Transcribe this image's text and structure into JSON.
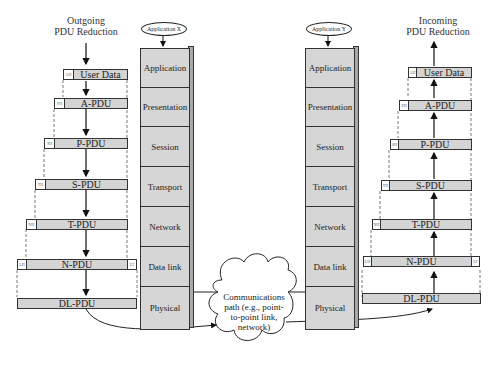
{
  "left": {
    "caption_line1": "Outgoing",
    "caption_line2": "PDU Reduction",
    "pdus": [
      {
        "label": "User Data",
        "header": "AH"
      },
      {
        "label": "A-PDU",
        "header": "PH"
      },
      {
        "label": "P-PDU",
        "header": "SH"
      },
      {
        "label": "S-PDU",
        "header": "TH"
      },
      {
        "label": "T-PDU",
        "header": "NH"
      },
      {
        "label": "N-PDU",
        "header": "LH",
        "trailer": "LT"
      },
      {
        "label": "DL-PDU"
      }
    ]
  },
  "right": {
    "caption_line1": "Incoming",
    "caption_line2": "PDU Reduction",
    "pdus": [
      {
        "label": "User Data",
        "header": "AH"
      },
      {
        "label": "A-PDU",
        "header": "PH"
      },
      {
        "label": "P-PDU",
        "header": "SH"
      },
      {
        "label": "S-PDU",
        "header": "TH"
      },
      {
        "label": "T-PDU",
        "header": "NH"
      },
      {
        "label": "N-PDU",
        "header": "LH",
        "trailer": "LT"
      },
      {
        "label": "DL-PDU"
      }
    ]
  },
  "stack_x": {
    "app_label": "Application X",
    "layers": [
      "Application",
      "Presentation",
      "Session",
      "Transport",
      "Network",
      "Data link",
      "Physical"
    ]
  },
  "stack_y": {
    "app_label": "Application Y",
    "layers": [
      "Application",
      "Presentation",
      "Session",
      "Transport",
      "Network",
      "Data link",
      "Physical"
    ]
  },
  "cloud": {
    "line1": "Communications",
    "line2": "path (e.g., point-",
    "line3": "to-point link,",
    "line4": "network)"
  },
  "colors": {
    "pdu_fill": "#d4d4d4",
    "stack_fill": "#d6d6d6",
    "stack_side": "#a9a9a9",
    "stroke": "#333333"
  }
}
